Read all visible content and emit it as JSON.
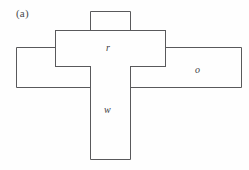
{
  "figure": {
    "panel_label": "(a)",
    "stroke_color": "#59595b",
    "background_color": "#fefefe",
    "text_color": "#3c3c3e",
    "canvas": {
      "width": 249,
      "height": 170
    },
    "regions": [
      {
        "id": "top-stub",
        "label": "",
        "x": 90,
        "y": 11,
        "width": 41,
        "height": 19
      },
      {
        "id": "r-bar",
        "label": "r",
        "x": 55,
        "y": 30,
        "width": 111,
        "height": 36
      },
      {
        "id": "left-bar",
        "label": "",
        "x": 16,
        "y": 47,
        "width": 39,
        "height": 40
      },
      {
        "id": "o-bar",
        "label": "o",
        "x": 166,
        "y": 47,
        "width": 76,
        "height": 40
      },
      {
        "id": "w-bar",
        "label": "w",
        "x": 90,
        "y": 66,
        "width": 41,
        "height": 94
      }
    ],
    "labels": {
      "r": "r",
      "o": "o",
      "w": "w"
    }
  }
}
